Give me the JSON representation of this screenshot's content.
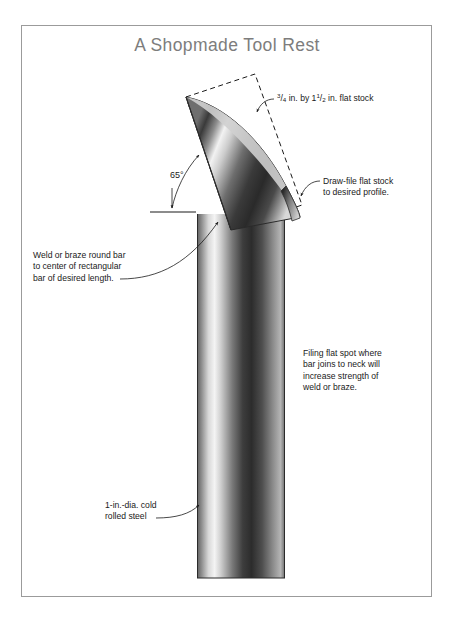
{
  "page": {
    "title": "A Shopmade Tool Rest",
    "title_color": "#7d7d7d",
    "frame_color": "#9b9b9b",
    "background": "#ffffff"
  },
  "annotations": {
    "flat_stock": {
      "whole_a": "3",
      "slash_a": "/",
      "part_a": "4",
      "mid": " in. by 1",
      "whole_b": "1",
      "slash_b": "/",
      "part_b": "2",
      "tail": " in. flat stock",
      "full_text": "3/4 in. by 1 1/2 in. flat stock"
    },
    "draw_file": {
      "line1": "Draw-file flat stock",
      "line2": "to desired profile."
    },
    "weld": {
      "line1": "Weld or braze round bar",
      "line2": "to center of rectangular",
      "line3": "bar of desired length."
    },
    "filing": {
      "line1": "Filing flat spot where",
      "line2": "bar joins to neck will",
      "line3": "increase strength of",
      "line4": "weld or braze."
    },
    "cold_rolled": {
      "line1": "1-in.-dia. cold",
      "line2": "rolled steel"
    },
    "angle": {
      "value": "65°"
    }
  },
  "drawing": {
    "type": "technical-illustration",
    "subject": "shopmade lathe tool rest",
    "parts": [
      {
        "name": "round-bar",
        "description": "1 in. dia. cold rolled steel vertical post",
        "material": "cold rolled steel"
      },
      {
        "name": "flat-stock-blade",
        "description": "3/4 in. by 1 1/2 in. flat stock draw-filed to a curved profile",
        "angle_degrees": 65
      },
      {
        "name": "stock-outline",
        "description": "dashed rectangle showing original flat stock before filing"
      }
    ]
  }
}
